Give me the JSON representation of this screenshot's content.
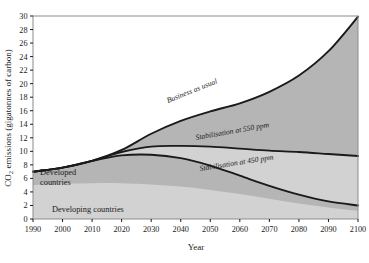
{
  "axes": {
    "ylabel": "CO2 emissions (gigatonnes of carbon)",
    "ylabel_prefix": "CO",
    "ylabel_sub": "2",
    "ylabel_rest": " emissions (gigatonnes of carbon)",
    "xlabel": "Year",
    "yticks": [
      0,
      2,
      4,
      6,
      8,
      10,
      12,
      14,
      16,
      18,
      20,
      22,
      24,
      26,
      28,
      30
    ],
    "xticks": [
      1990,
      2000,
      2010,
      2020,
      2030,
      2040,
      2050,
      2060,
      2070,
      2080,
      2090,
      2100
    ]
  },
  "colors": {
    "band_upper": "#b5b5b5",
    "band_lower": "#d2d2d2",
    "curve": "#1a1a1a",
    "frame": "#8c8c8c",
    "background": "#ffffff"
  },
  "annotations": {
    "business_as_usual": "Business as usual",
    "stab550": "Stabilisation at 550 ppm",
    "stab450": "Stabilisation at 450 ppm",
    "developed": "Developed",
    "developed2": "countries",
    "developing": "Developing countries"
  },
  "chart_data": {
    "type": "line",
    "title": "",
    "xlabel": "Year",
    "ylabel": "CO2 emissions (gigatonnes of carbon)",
    "xlim": [
      1990,
      2100
    ],
    "ylim": [
      0,
      30
    ],
    "grid": false,
    "legend": "inline-annotations",
    "x": [
      1990,
      2000,
      2010,
      2020,
      2030,
      2040,
      2050,
      2060,
      2070,
      2080,
      2090,
      2100
    ],
    "series": [
      {
        "name": "Business as usual",
        "values": [
          7.0,
          7.6,
          8.6,
          10.2,
          12.6,
          14.5,
          15.9,
          17.1,
          18.8,
          21.2,
          24.8,
          29.9
        ]
      },
      {
        "name": "Stabilisation at 550 ppm",
        "values": [
          7.0,
          7.6,
          8.6,
          9.9,
          10.7,
          10.8,
          10.7,
          10.4,
          10.1,
          9.9,
          9.6,
          9.3
        ]
      },
      {
        "name": "Stabilisation at 450 ppm",
        "values": [
          7.0,
          7.6,
          8.6,
          9.4,
          9.5,
          9.0,
          7.9,
          6.4,
          4.9,
          3.6,
          2.6,
          2.0
        ]
      },
      {
        "name": "Developed countries",
        "values": [
          5.0,
          5.2,
          5.3,
          5.3,
          5.1,
          4.8,
          4.3,
          3.7,
          3.0,
          2.3,
          1.7,
          1.2
        ]
      }
    ],
    "bands": [
      {
        "name": "Business as usual above 550",
        "upper": "Business as usual",
        "lower": "Stabilisation at 550 ppm",
        "color": "#b5b5b5"
      },
      {
        "name": "550 down to zero",
        "upper": "Stabilisation at 550 ppm",
        "lower": "zero",
        "color": "#d2d2d2"
      }
    ]
  }
}
